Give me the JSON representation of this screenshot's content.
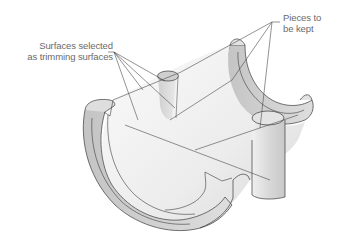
{
  "figure": {
    "type": "technical-illustration",
    "labels": {
      "trimming_surfaces": {
        "line1": "Surfaces selected",
        "line2": "as trimming surfaces"
      },
      "pieces_kept": {
        "line1": "Pieces to",
        "line2": "be kept"
      }
    },
    "colors": {
      "background": "#ffffff",
      "outline": "#3a3a3a",
      "leader": "#4a4a4a",
      "surface_light": "#f2f2f2",
      "surface_mid": "#d4d4d4",
      "surface_dark": "#bdbdbd",
      "text": "#6a6a6a"
    }
  }
}
